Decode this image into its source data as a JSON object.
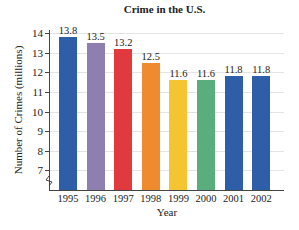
{
  "chart_data": {
    "type": "bar",
    "title": "Crime in the U.S.",
    "xlabel": "Year",
    "ylabel": "Number of Crimes (millions)",
    "categories": [
      "1995",
      "1996",
      "1997",
      "1998",
      "1999",
      "2000",
      "2001",
      "2002"
    ],
    "values": [
      13.8,
      13.5,
      13.2,
      12.5,
      11.6,
      11.6,
      11.8,
      11.8
    ],
    "value_labels": [
      "13.8",
      "13.5",
      "13.2",
      "12.5",
      "11.6",
      "11.6",
      "11.8",
      "11.8"
    ],
    "colors": [
      "#2f5ea8",
      "#8e7fb0",
      "#e03a3e",
      "#ef8a2f",
      "#f4c531",
      "#5aae7e",
      "#2f5ea8",
      "#2f5ea8"
    ],
    "yticks": [
      "7",
      "8",
      "9",
      "10",
      "11",
      "12",
      "13",
      "14"
    ],
    "ylim": [
      6,
      14.3
    ],
    "axis_break": true,
    "grid": true,
    "legend": "none"
  }
}
